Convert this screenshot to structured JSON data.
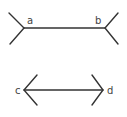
{
  "figure": {
    "stroke_color": "#333333",
    "label_color": "#444444",
    "background": "#ffffff"
  },
  "top_figure": {
    "left_label": "a",
    "right_label": "b",
    "fin_style": "outward-fins (tails)",
    "shaft": {
      "x1": 24,
      "y1": 28,
      "x2": 105,
      "y2": 28
    }
  },
  "bottom_figure": {
    "left_label": "c",
    "right_label": "d",
    "fin_style": "inward-fins (arrowheads)",
    "shaft": {
      "x1": 24,
      "y1": 90,
      "x2": 103,
      "y2": 90
    }
  }
}
